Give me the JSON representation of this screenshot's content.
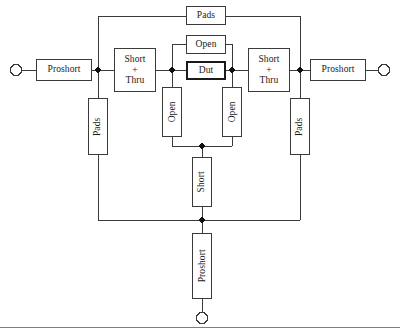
{
  "diagram": {
    "colors": {
      "line": "#3a3a3a",
      "node": "#111111",
      "dut_border": "#1a1a1a",
      "background": "#ffffff",
      "rule": "#808080"
    },
    "terminals": [
      {
        "name": "left-port",
        "label": ""
      },
      {
        "name": "right-port",
        "label": ""
      },
      {
        "name": "bottom-port",
        "label": ""
      }
    ],
    "blocks": {
      "proshort_left": "Proshort",
      "proshort_right": "Proshort",
      "proshort_bottom": "Proshort",
      "short_thru_left_line1": "Short",
      "short_thru_left_line2": "+",
      "short_thru_left_line3": "Thru",
      "short_thru_right_line1": "Short",
      "short_thru_right_line2": "+",
      "short_thru_right_line3": "Thru",
      "pads_top": "Pads",
      "pads_left": "Pads",
      "pads_right": "Pads",
      "open_top": "Open",
      "open_left": "Open",
      "open_right": "Open",
      "dut": "Dut",
      "short_bottom": "Short"
    }
  }
}
